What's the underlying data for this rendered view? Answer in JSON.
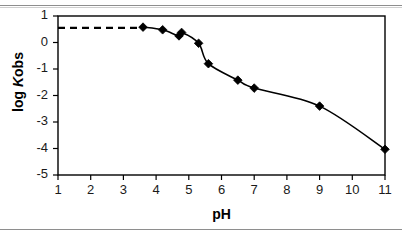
{
  "figure": {
    "background_color": "#ffffff",
    "rule_color": "#8e8e8e"
  },
  "chart_data": {
    "type": "line",
    "title": "",
    "xlabel": "pH",
    "ylabel_prefix": "log ",
    "ylabel_italic": "K",
    "ylabel_suffix": "obs",
    "ylabel": "log Kobs",
    "xlim": [
      1,
      11
    ],
    "ylim": [
      -5,
      1
    ],
    "xticks": [
      1,
      2,
      3,
      4,
      5,
      6,
      7,
      8,
      9,
      10,
      11
    ],
    "xtick_labels": [
      "1",
      "2",
      "3",
      "4",
      "5",
      "6",
      "7",
      "8",
      "9",
      "10",
      "11"
    ],
    "yticks": [
      1,
      0,
      -1,
      -2,
      -3,
      -4,
      -5
    ],
    "ytick_labels": [
      "1",
      "0",
      "-1",
      "-2",
      "-3",
      "-4",
      "-5"
    ],
    "grid": false,
    "legend": false,
    "legend_position": "none",
    "marker": "filled-diamond",
    "marker_color": "#000000",
    "line_color": "#000000",
    "series": [
      {
        "name": "log Kobs vs pH",
        "x": [
          3.6,
          4.2,
          4.7,
          4.78,
          5.3,
          5.6,
          6.5,
          7.0,
          9.0,
          11.0
        ],
        "y": [
          0.58,
          0.48,
          0.25,
          0.38,
          -0.03,
          -0.8,
          -1.42,
          -1.72,
          -2.4,
          -4.03
        ]
      }
    ],
    "extrapolation": {
      "style": "dashed",
      "x": [
        1.0,
        3.6
      ],
      "y": [
        0.55,
        0.55
      ]
    }
  }
}
